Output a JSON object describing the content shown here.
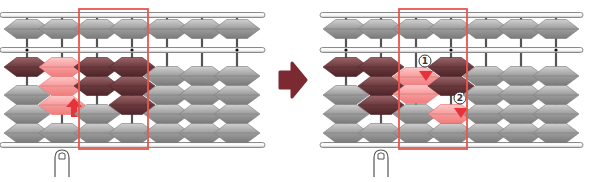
{
  "diagram": {
    "colors": {
      "bead_gray": "#9a9a9a",
      "bead_gray_light": "#c8c8c8",
      "bead_gray_dark": "#6e6e6e",
      "bead_set": "#6b3a3e",
      "bead_set_light": "#8e5a5e",
      "bead_moving": "#f59a9a",
      "bead_moving_light": "#ffc4c4",
      "highlight_box": "#e8574f",
      "arrow": "#7a2a30",
      "move_arrow": "#e8323a",
      "frame": "#8a8a8a",
      "rod": "#555555"
    },
    "transition_arrow": {
      "icon": "right-arrow-icon"
    },
    "panels": [
      {
        "name": "before",
        "x": 0,
        "rods_x": [
          27,
          62,
          97,
          132,
          167,
          202,
          237
        ],
        "frame_x": [
          0,
          265
        ],
        "highlight_box": {
          "x": 79,
          "w": 69
        },
        "finger_rod": 1,
        "rods": [
          {
            "upper": "rest",
            "lower": [
              "set",
              "rest",
              "rest",
              "rest"
            ],
            "lower_up_count": 1
          },
          {
            "upper": "rest",
            "lower": [
              "moving",
              "moving",
              "moving",
              "rest"
            ],
            "lower_up_count": 3,
            "arrow": "up"
          },
          {
            "upper": "rest",
            "lower": [
              "set",
              "set",
              "rest",
              "rest"
            ],
            "lower_up_count": 2
          },
          {
            "upper": "rest",
            "lower": [
              "set",
              "set",
              "set",
              "rest"
            ],
            "lower_up_count": 3
          },
          {
            "upper": "rest",
            "lower": [
              "rest",
              "rest",
              "rest",
              "rest"
            ],
            "lower_up_count": 0
          },
          {
            "upper": "rest",
            "lower": [
              "rest",
              "rest",
              "rest",
              "rest"
            ],
            "lower_up_count": 0
          },
          {
            "upper": "rest",
            "lower": [
              "rest",
              "rest",
              "rest",
              "rest"
            ],
            "lower_up_count": 0
          }
        ],
        "unit_dots": [
          0,
          3,
          6
        ]
      },
      {
        "name": "after",
        "x": 320,
        "rods_x": [
          346,
          381,
          416,
          451,
          486,
          521,
          556
        ],
        "frame_x": [
          320,
          583
        ],
        "highlight_box": {
          "x": 399,
          "w": 68
        },
        "finger_rod": 1,
        "rods": [
          {
            "upper": "rest",
            "lower": [
              "set",
              "rest",
              "rest",
              "rest"
            ],
            "lower_up_count": 1
          },
          {
            "upper": "rest",
            "lower": [
              "set",
              "set",
              "set",
              "rest"
            ],
            "lower_up_count": 3
          },
          {
            "upper": "rest",
            "lower": [
              "moving",
              "moving",
              "rest",
              "rest"
            ],
            "lower_up_count": 0,
            "moving_offset": 1,
            "marker": "1"
          },
          {
            "upper": "rest",
            "lower": [
              "set",
              "set",
              "moving",
              "rest"
            ],
            "lower_up_count": 2,
            "marker": "2"
          },
          {
            "upper": "rest",
            "lower": [
              "rest",
              "rest",
              "rest",
              "rest"
            ],
            "lower_up_count": 0
          },
          {
            "upper": "rest",
            "lower": [
              "rest",
              "rest",
              "rest",
              "rest"
            ],
            "lower_up_count": 0
          },
          {
            "upper": "rest",
            "lower": [
              "rest",
              "rest",
              "rest",
              "rest"
            ],
            "lower_up_count": 0
          }
        ],
        "unit_dots": [
          0,
          3,
          6
        ]
      }
    ],
    "step_markers": [
      "1",
      "2"
    ]
  }
}
